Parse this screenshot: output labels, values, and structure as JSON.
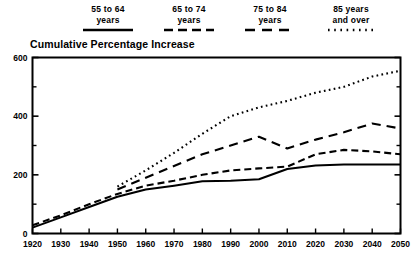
{
  "chart_data": {
    "type": "line",
    "title": "Cumulative Percentage Increase",
    "xlabel": "",
    "ylabel": "",
    "xlim": [
      1920,
      2050
    ],
    "ylim": [
      0,
      600
    ],
    "grid": false,
    "legend_position": "top",
    "y_ticks": [
      0,
      200,
      400,
      600
    ],
    "y_minor_ticks": [
      100,
      300,
      500
    ],
    "x_ticks": [
      1920,
      1930,
      1940,
      1950,
      1960,
      1970,
      1980,
      1990,
      2000,
      2010,
      2020,
      2030,
      2040,
      2050
    ],
    "x": [
      1920,
      1930,
      1940,
      1950,
      1960,
      1970,
      1980,
      1990,
      2000,
      2010,
      2020,
      2030,
      2040,
      2050
    ],
    "series": [
      {
        "name": "55 to 64 years",
        "legend_label": "55 to 64\nyears",
        "style": "solid",
        "x": [
          1920,
          1930,
          1940,
          1950,
          1960,
          1970,
          1980,
          1990,
          2000,
          2010,
          2020,
          2030,
          2040,
          2050
        ],
        "values": [
          20,
          55,
          90,
          125,
          150,
          163,
          178,
          180,
          185,
          220,
          232,
          235,
          235,
          235
        ]
      },
      {
        "name": "65 to 74 years",
        "legend_label": "65 to 74\nyears",
        "style": "dashed",
        "x": [
          1920,
          1930,
          1940,
          1950,
          1960,
          1970,
          1980,
          1990,
          2000,
          2010,
          2020,
          2030,
          2040,
          2050
        ],
        "values": [
          28,
          62,
          100,
          135,
          163,
          180,
          200,
          215,
          222,
          228,
          270,
          285,
          280,
          270
        ]
      },
      {
        "name": "75 to 84 years",
        "legend_label": "75 to 84\nyears",
        "style": "long-dashed",
        "x": [
          1950,
          1960,
          1970,
          1980,
          1990,
          2000,
          2010,
          2020,
          2030,
          2040,
          2050
        ],
        "values": [
          150,
          190,
          230,
          270,
          300,
          330,
          290,
          320,
          345,
          375,
          358
        ]
      },
      {
        "name": "85 years and over",
        "legend_label": "85 years\nand over",
        "style": "dotted",
        "x": [
          1950,
          1960,
          1970,
          1980,
          1990,
          2000,
          2010,
          2020,
          2030,
          2040,
          2050
        ],
        "values": [
          160,
          215,
          275,
          340,
          400,
          430,
          452,
          480,
          500,
          535,
          555
        ]
      }
    ]
  },
  "legend": {
    "items": [
      {
        "label": "55 to 64\nyears",
        "style": "solid"
      },
      {
        "label": "65 to 74\nyears",
        "style": "dashed"
      },
      {
        "label": "75 to 84\nyears",
        "style": "long-dashed"
      },
      {
        "label": "85 years\nand over",
        "style": "dotted"
      }
    ]
  },
  "colors": {
    "ink": "#000000",
    "background": "#ffffff"
  }
}
